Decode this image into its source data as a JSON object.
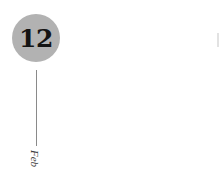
{
  "date_marker": {
    "day": "12",
    "month": "Feb",
    "circle_color": "#b2b2b2",
    "line_color": "#8a8a8a"
  }
}
